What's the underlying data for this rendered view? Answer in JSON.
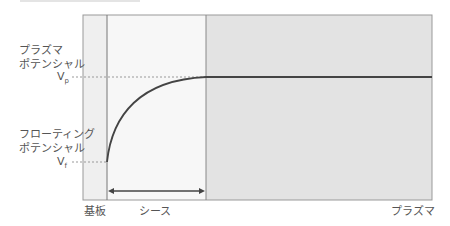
{
  "diagram": {
    "labels": {
      "plasma_potential_line1": "プラズマ",
      "plasma_potential_line2": "ポテンシャル",
      "vp_main": "V",
      "vp_sub": "p",
      "floating_potential_line1": "フローティング",
      "floating_potential_line2": "ポテンシャル",
      "vf_main": "V",
      "vf_sub": "f",
      "substrate": "基板",
      "sheath": "シース",
      "plasma": "プラズマ"
    },
    "regions": [
      {
        "name": "substrate",
        "x_start": 83,
        "x_end": 107,
        "color": "#efefef"
      },
      {
        "name": "sheath",
        "x_start": 107,
        "x_end": 206,
        "color": "#f6f6f6"
      },
      {
        "name": "plasma",
        "x_start": 206,
        "x_end": 432,
        "color": "#e2e2e2"
      }
    ],
    "colors": {
      "border": "#888888",
      "curve": "#444444",
      "dashed": "#999999"
    }
  }
}
